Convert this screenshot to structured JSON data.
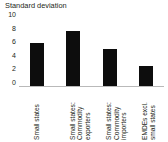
{
  "chart_data": {
    "type": "bar",
    "title": "Standard deviation",
    "xlabel": "",
    "ylabel": "",
    "ylim": [
      0,
      10
    ],
    "ytick_labels": [
      "10",
      "8",
      "6",
      "4",
      "2",
      "0"
    ],
    "ytick_values": [
      10,
      8,
      6,
      4,
      2,
      0
    ],
    "grid": false,
    "legend": "none",
    "bar_color": "#0d0d0d",
    "axis_color": "#b9b9b9",
    "categories": [
      "Small states",
      "Small states: Commodity exporters",
      "Small states: Commodity importers",
      "EMDEs excl. small states"
    ],
    "category_lines": [
      [
        "Small states"
      ],
      [
        "Small states:",
        "Commodity",
        "exporters"
      ],
      [
        "Small states:",
        "Commodity",
        "importers"
      ],
      [
        "EMDEs excl.",
        "small states"
      ]
    ],
    "values": [
      6.3,
      8.1,
      5.4,
      3.0
    ]
  }
}
